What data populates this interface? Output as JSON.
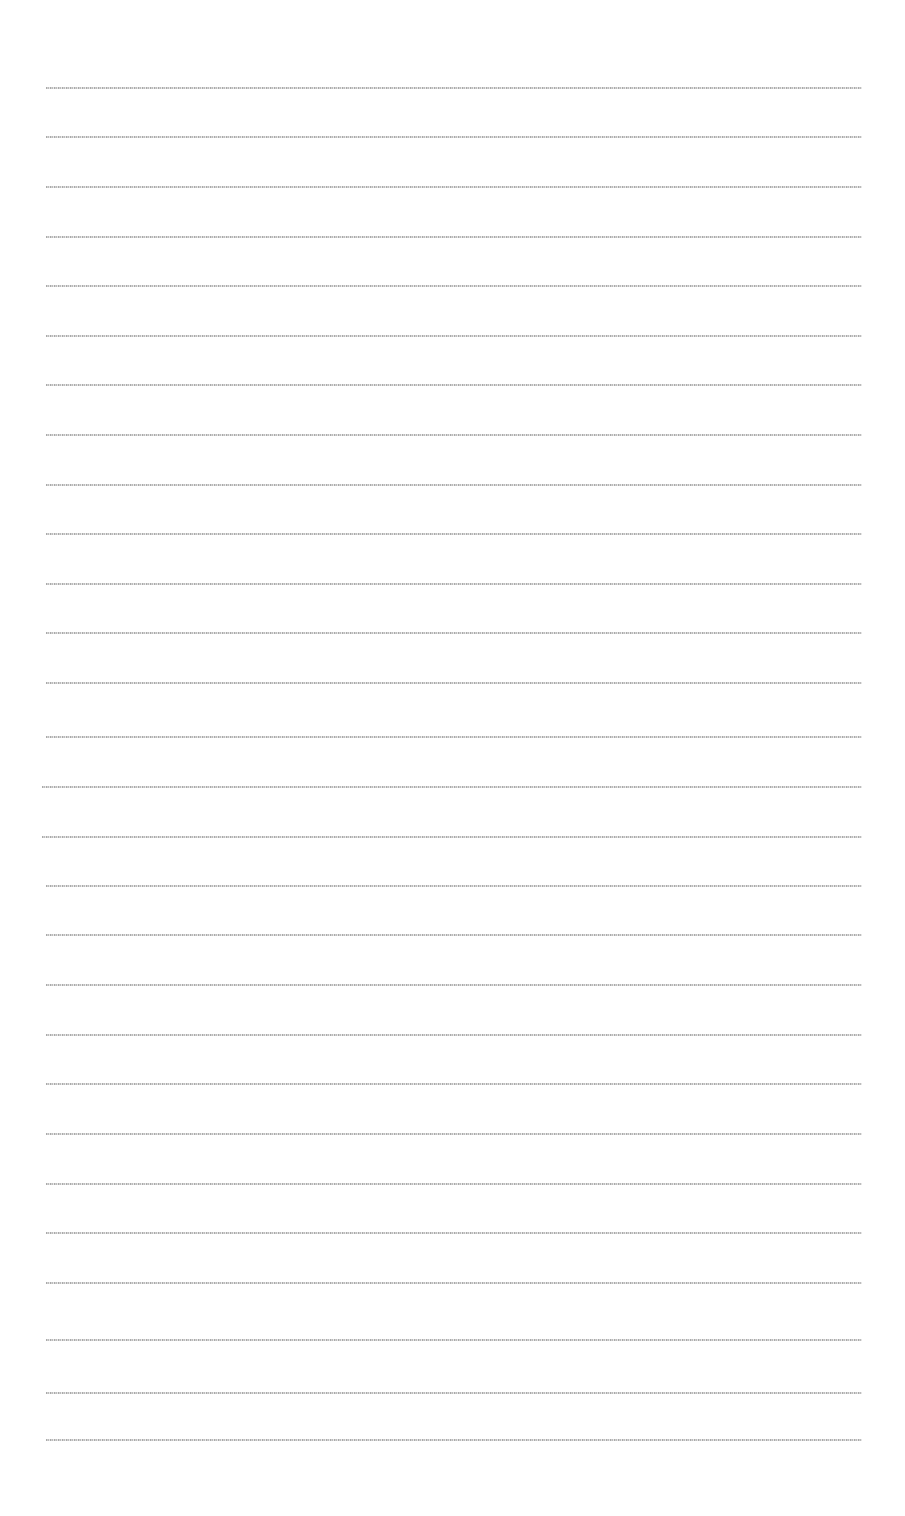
{
  "document": {
    "background": "#ffffff",
    "text_color": "#9a9a9a",
    "legibility": "illegible — text rendered ~1-2px tall; characters cannot be recovered from the screenshot",
    "rows": [
      {
        "y": 87,
        "x_start": 46,
        "x_end": 862,
        "text": "[illegible]"
      },
      {
        "y": 136,
        "x_start": 46,
        "x_end": 862,
        "text": "[illegible]"
      },
      {
        "y": 186,
        "x_start": 46,
        "x_end": 862,
        "text": "[illegible]"
      },
      {
        "y": 236,
        "x_start": 46,
        "x_end": 862,
        "text": "[illegible]"
      },
      {
        "y": 285,
        "x_start": 46,
        "x_end": 862,
        "text": "[illegible]"
      },
      {
        "y": 335,
        "x_start": 46,
        "x_end": 862,
        "text": "[illegible]"
      },
      {
        "y": 384,
        "x_start": 46,
        "x_end": 862,
        "text": "[illegible]"
      },
      {
        "y": 434,
        "x_start": 46,
        "x_end": 862,
        "text": "[illegible]"
      },
      {
        "y": 484,
        "x_start": 46,
        "x_end": 862,
        "text": "[illegible]"
      },
      {
        "y": 533,
        "x_start": 46,
        "x_end": 862,
        "text": "[illegible]"
      },
      {
        "y": 583,
        "x_start": 46,
        "x_end": 862,
        "text": "[illegible]"
      },
      {
        "y": 632,
        "x_start": 46,
        "x_end": 862,
        "text": "[illegible]"
      },
      {
        "y": 682,
        "x_start": 46,
        "x_end": 862,
        "text": "[illegible]"
      },
      {
        "y": 736,
        "x_start": 46,
        "x_end": 862,
        "text": "[illegible]"
      },
      {
        "y": 786,
        "x_start": 42,
        "x_end": 862,
        "text": "[illegible]"
      },
      {
        "y": 836,
        "x_start": 42,
        "x_end": 862,
        "text": "[illegible]"
      },
      {
        "y": 885,
        "x_start": 46,
        "x_end": 862,
        "text": "[illegible]"
      },
      {
        "y": 934,
        "x_start": 46,
        "x_end": 862,
        "text": "[illegible]"
      },
      {
        "y": 984,
        "x_start": 46,
        "x_end": 862,
        "text": "[illegible]"
      },
      {
        "y": 1034,
        "x_start": 46,
        "x_end": 862,
        "text": "[illegible]"
      },
      {
        "y": 1083,
        "x_start": 46,
        "x_end": 862,
        "text": "[illegible]"
      },
      {
        "y": 1133,
        "x_start": 46,
        "x_end": 862,
        "text": "[illegible]"
      },
      {
        "y": 1183,
        "x_start": 46,
        "x_end": 862,
        "text": "[illegible]"
      },
      {
        "y": 1232,
        "x_start": 46,
        "x_end": 862,
        "text": "[illegible]"
      },
      {
        "y": 1282,
        "x_start": 46,
        "x_end": 862,
        "text": "[illegible]"
      },
      {
        "y": 1339,
        "x_start": 46,
        "x_end": 862,
        "text": "[illegible]"
      },
      {
        "y": 1392,
        "x_start": 46,
        "x_end": 862,
        "text": "[illegible]"
      },
      {
        "y": 1439,
        "x_start": 46,
        "x_end": 862,
        "text": "[illegible]"
      }
    ]
  }
}
